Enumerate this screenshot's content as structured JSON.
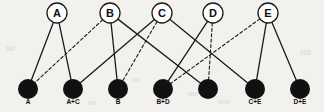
{
  "diagram": {
    "type": "bipartite-graph",
    "width": 324,
    "height": 112,
    "background_color": "#f2f1ee",
    "edge_color": "#1a1a1a",
    "node_fill": "#111111",
    "circle_fill": "#ffffff",
    "circle_stroke": "#1a1a1a",
    "top_nodes": [
      {
        "id": "A",
        "label": "A",
        "cx": 57,
        "cy": 13,
        "r": 10
      },
      {
        "id": "B",
        "label": "B",
        "cx": 110,
        "cy": 13,
        "r": 10
      },
      {
        "id": "C",
        "label": "C",
        "cx": 162,
        "cy": 13,
        "r": 10
      },
      {
        "id": "D",
        "label": "D",
        "cx": 213,
        "cy": 13,
        "r": 10
      },
      {
        "id": "E",
        "label": "E",
        "cx": 268,
        "cy": 13,
        "r": 10
      }
    ],
    "bottom_nodes": [
      {
        "id": "n1",
        "label": "A",
        "cx": 28,
        "cy": 89,
        "r": 10
      },
      {
        "id": "n2",
        "label": "A+C",
        "cx": 73,
        "cy": 89,
        "r": 10
      },
      {
        "id": "n3",
        "label": "B",
        "cx": 118,
        "cy": 89,
        "r": 10
      },
      {
        "id": "n4",
        "label": "B+D",
        "cx": 163,
        "cy": 89,
        "r": 10
      },
      {
        "id": "n5",
        "label": "",
        "cx": 208,
        "cy": 89,
        "r": 10
      },
      {
        "id": "n6",
        "label": "C+E",
        "cx": 255,
        "cy": 89,
        "r": 10
      },
      {
        "id": "n7",
        "label": "D+E",
        "cx": 300,
        "cy": 89,
        "r": 10
      }
    ],
    "edges": [
      {
        "from": "A",
        "to": "n1",
        "style": "solid"
      },
      {
        "from": "A",
        "to": "n2",
        "style": "solid"
      },
      {
        "from": "B",
        "to": "n1",
        "style": "dashed"
      },
      {
        "from": "B",
        "to": "n3",
        "style": "solid"
      },
      {
        "from": "B",
        "to": "n5",
        "style": "solid"
      },
      {
        "from": "C",
        "to": "n2",
        "style": "solid"
      },
      {
        "from": "C",
        "to": "n3",
        "style": "dashed"
      },
      {
        "from": "C",
        "to": "n6",
        "style": "solid"
      },
      {
        "from": "D",
        "to": "n4",
        "style": "solid"
      },
      {
        "from": "D",
        "to": "n5",
        "style": "dashed"
      },
      {
        "from": "E",
        "to": "n4",
        "style": "dashed"
      },
      {
        "from": "E",
        "to": "n6",
        "style": "solid"
      },
      {
        "from": "E",
        "to": "n7",
        "style": "solid"
      }
    ]
  }
}
